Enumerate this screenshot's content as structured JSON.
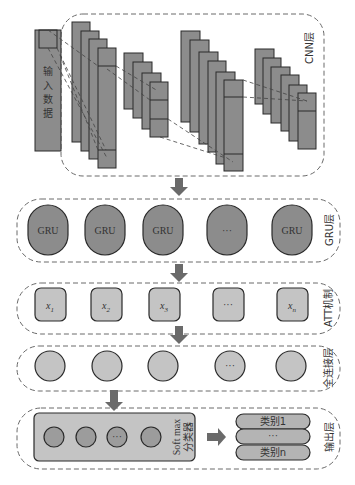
{
  "diagram": {
    "colors": {
      "dark_block": "#8c8c8c",
      "light_block": "#c4c4c4",
      "stroke": "#2a2a2a",
      "frame": "#6a6a6a",
      "arrow": "#6a6a6a"
    },
    "input": {
      "label_chars": [
        "输",
        "入",
        "数",
        "据"
      ]
    },
    "layers": {
      "cnn": {
        "label": "CNN层"
      },
      "gru": {
        "label": "GRU层",
        "nodes": [
          "GRU",
          "GRU",
          "GRU",
          "···",
          "GRU"
        ]
      },
      "att": {
        "label": "ATT机制",
        "nodes": [
          {
            "base": "x",
            "sub": "1"
          },
          {
            "base": "x",
            "sub": "2"
          },
          {
            "base": "x",
            "sub": "3"
          },
          {
            "base": "···",
            "sub": ""
          },
          {
            "base": "x",
            "sub": "n"
          }
        ]
      },
      "fc": {
        "label": "全连接层",
        "nodes": [
          "",
          "",
          "",
          "···",
          ""
        ]
      },
      "output": {
        "label": "输出层",
        "softmax": {
          "label_line1": "Soft max",
          "label_line2": "分类器",
          "nodes": [
            "",
            "",
            "···",
            ""
          ]
        },
        "classes": [
          "类别1",
          "···",
          "类别n"
        ]
      }
    }
  }
}
